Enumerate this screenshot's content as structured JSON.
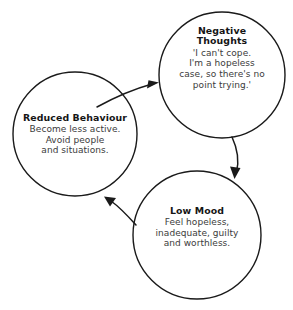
{
  "diagram": {
    "background_color": "#ffffff",
    "stroke_color": "#1a1a1a",
    "title_color": "#151515",
    "body_color": "#3b3b3b",
    "nodes": [
      {
        "id": "negative-thoughts",
        "title": "Negative\nThoughts",
        "title_line1": "Negative",
        "title_line2": "Thoughts",
        "body_lines": [
          "'I can't cope.",
          "I'm a hopeless",
          "case, so there's no",
          "point trying.'"
        ],
        "cx": 222,
        "cy": 75,
        "r": 63
      },
      {
        "id": "reduced-behaviour",
        "title": "Reduced Behaviour",
        "body_lines": [
          "Become less active.",
          "Avoid people",
          "and situations."
        ],
        "cx": 75,
        "cy": 134,
        "r": 62
      },
      {
        "id": "low-mood",
        "title": "Low Mood",
        "body_lines": [
          "Feel hopeless,",
          "inadequate, guilty",
          "and worthless."
        ],
        "cx": 197,
        "cy": 235,
        "r": 64
      }
    ],
    "arrows": [
      {
        "id": "reduced-behaviour-to-negative-thoughts",
        "from": "reduced-behaviour",
        "to": "negative-thoughts",
        "direction": "up-right"
      },
      {
        "id": "negative-thoughts-to-low-mood",
        "from": "negative-thoughts",
        "to": "low-mood",
        "direction": "down"
      },
      {
        "id": "low-mood-to-reduced-behaviour",
        "from": "low-mood",
        "to": "reduced-behaviour",
        "direction": "up-left"
      }
    ]
  }
}
